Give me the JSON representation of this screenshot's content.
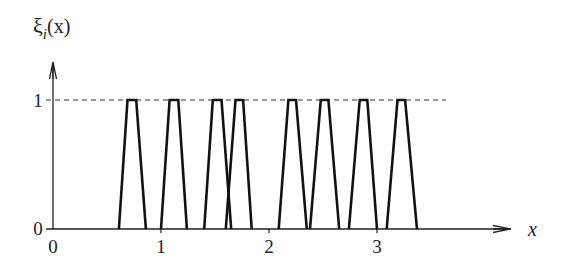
{
  "chart_data": {
    "type": "line",
    "title": "",
    "ylabel": "ξ_i(x)",
    "ylabel_main": "ξ",
    "ylabel_sub": "i",
    "ylabel_arg": "(x)",
    "xlabel": "x",
    "x_ticks": [
      "0",
      "1",
      "2",
      "3"
    ],
    "y_ticks": [
      "0",
      "1"
    ],
    "xlim": [
      0,
      4.2
    ],
    "ylim": [
      0,
      1.35
    ],
    "reference_line": {
      "y": 1,
      "style": "dashed"
    },
    "grid": false,
    "legend": null,
    "series": [
      {
        "name": "trapezoid 1",
        "x": [
          0.61,
          0.69,
          0.77,
          0.86
        ],
        "y": [
          0,
          1,
          1,
          0
        ]
      },
      {
        "name": "trapezoid 2",
        "x": [
          1.0,
          1.08,
          1.16,
          1.24
        ],
        "y": [
          0,
          1,
          1,
          0
        ]
      },
      {
        "name": "trapezoid 3",
        "x": [
          1.4,
          1.48,
          1.56,
          1.65
        ],
        "y": [
          0,
          1,
          1,
          0
        ]
      },
      {
        "name": "trapezoid 4",
        "x": [
          1.6,
          1.69,
          1.76,
          1.84
        ],
        "y": [
          0,
          1,
          1,
          0
        ]
      },
      {
        "name": "trapezoid 5",
        "x": [
          2.09,
          2.18,
          2.25,
          2.35
        ],
        "y": [
          0,
          1,
          1,
          0
        ]
      },
      {
        "name": "trapezoid 6",
        "x": [
          2.38,
          2.48,
          2.55,
          2.65
        ],
        "y": [
          0,
          1,
          1,
          0
        ]
      },
      {
        "name": "trapezoid 7",
        "x": [
          2.74,
          2.84,
          2.91,
          3.0
        ],
        "y": [
          0,
          1,
          1,
          0
        ]
      },
      {
        "name": "trapezoid 8",
        "x": [
          3.09,
          3.19,
          3.26,
          3.37
        ],
        "y": [
          0,
          1,
          1,
          0
        ]
      }
    ]
  }
}
